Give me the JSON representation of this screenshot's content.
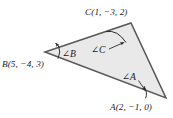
{
  "figure": {
    "type": "geometry-diagram",
    "background_color": "#ffffff",
    "triangle": {
      "fill_color": "#e8e8e8",
      "stroke_color": "#58585a",
      "vertices": [
        {
          "name": "B",
          "x": 45,
          "y": 52
        },
        {
          "name": "C",
          "x": 131,
          "y": 23
        },
        {
          "name": "A",
          "x": 166,
          "y": 98
        }
      ]
    },
    "vertex_labels": [
      {
        "id": "C",
        "text": "C(1, −3, 2)"
      },
      {
        "id": "B",
        "text": "B(5, −4, 3)"
      },
      {
        "id": "A",
        "text": "A(2, −1, 0)"
      }
    ],
    "angle_labels": [
      {
        "id": "B",
        "text": "∠B"
      },
      {
        "id": "C",
        "text": "∠C"
      },
      {
        "id": "A",
        "text": "∠A"
      }
    ]
  }
}
